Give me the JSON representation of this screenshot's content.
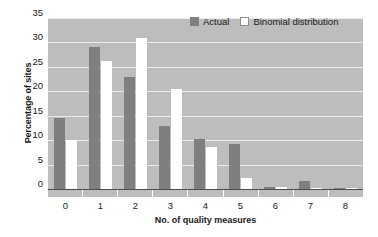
{
  "chart_data": {
    "type": "bar",
    "title": "",
    "xlabel": "No. of quality measures",
    "ylabel": "Percentage of sites",
    "categories": [
      "0",
      "1",
      "2",
      "3",
      "4",
      "5",
      "6",
      "7",
      "8"
    ],
    "series": [
      {
        "name": "Actual",
        "color": "#7f7f7f",
        "values": [
          14.5,
          29.0,
          23.0,
          13.0,
          10.2,
          9.3,
          0.4,
          1.6,
          0.3
        ]
      },
      {
        "name": "Binomial distribution",
        "color": "#ffffff",
        "values": [
          10.0,
          26.3,
          31.0,
          20.4,
          8.7,
          2.3,
          0.4,
          0.1,
          0.1
        ]
      }
    ],
    "ylim": [
      0,
      35
    ],
    "yticks": [
      "0",
      "5",
      "10",
      "15",
      "20",
      "25",
      "30",
      "35"
    ],
    "ytick_values": [
      0,
      5,
      10,
      15,
      20,
      25,
      30,
      35
    ],
    "grid": true,
    "grid_color": "#eaeaea",
    "plot_background": "#bdbdbd",
    "legend_position": "top-right"
  },
  "legend": {
    "entries": [
      {
        "label": "Actual",
        "swatch": "actual-swatch"
      },
      {
        "label": "Binomial distribution",
        "swatch": "binomial-swatch"
      }
    ]
  }
}
